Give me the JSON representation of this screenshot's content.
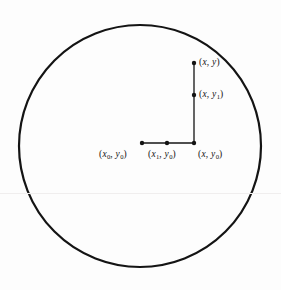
{
  "figure": {
    "kind": "geometric-diagram",
    "background_color": "#fdfdfd",
    "stroke_color": "#141414",
    "scan_line_color": "#f0eeee",
    "circle": {
      "center_x": 140,
      "center_y": 146,
      "radius": 121,
      "stroke_width": 2.2
    },
    "horizontal_segment": {
      "x_start": 142,
      "x_end": 194,
      "y": 143,
      "stroke_width": 1.3
    },
    "vertical_segment": {
      "x": 194,
      "y_start": 63,
      "y_end": 143,
      "stroke_width": 1.3
    },
    "points": [
      {
        "name": "point-x0-y0",
        "cx": 142,
        "cy": 143,
        "r": 2.2
      },
      {
        "name": "point-x1-y0",
        "cx": 167,
        "cy": 143,
        "r": 2.2
      },
      {
        "name": "point-x-y0",
        "cx": 194,
        "cy": 143,
        "r": 2.2
      },
      {
        "name": "point-x-y1",
        "cx": 194,
        "cy": 95,
        "r": 2.2
      },
      {
        "name": "point-x-y",
        "cx": 194,
        "cy": 63,
        "r": 2.2
      }
    ],
    "labels": {
      "point_xy": {
        "open": "(",
        "var1": "x",
        "sub1": "",
        "comma": ", ",
        "var2": "y",
        "sub2": "",
        "close": ")"
      },
      "point_xy1": {
        "open": "(",
        "var1": "x",
        "sub1": "",
        "comma": ", ",
        "var2": "y",
        "sub2": "1",
        "close": ")"
      },
      "point_x0y0": {
        "open": "(",
        "var1": "x",
        "sub1": "0",
        "comma": ", ",
        "var2": "y",
        "sub2": "0",
        "close": ")"
      },
      "point_x1y0": {
        "open": "(",
        "var1": "x",
        "sub1": "1",
        "comma": ", ",
        "var2": "y",
        "sub2": "0",
        "close": ")"
      },
      "point_xy0": {
        "open": "(",
        "var1": "x",
        "sub1": "",
        "comma": ", ",
        "var2": "y",
        "sub2": "0",
        "close": ")"
      }
    }
  }
}
